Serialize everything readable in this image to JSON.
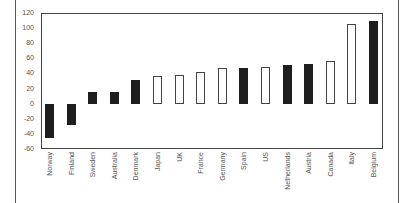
{
  "chart_data": {
    "type": "bar",
    "title": "",
    "xlabel": "",
    "ylabel": "",
    "ylim": [
      -60,
      120
    ],
    "yticks": [
      120,
      100,
      80,
      60,
      40,
      20,
      0,
      -20,
      -40,
      -60
    ],
    "grid": false,
    "legend": null,
    "categories": [
      "Norway",
      "Finland",
      "Sweden",
      "Australia",
      "Denmark",
      "Japan",
      "UK",
      "France",
      "Germany",
      "Spain",
      "US",
      "Netherlands",
      "Austria",
      "Canada",
      "Italy",
      "Belgium"
    ],
    "values": [
      -46,
      -28,
      15,
      16,
      31,
      36,
      38,
      42,
      47,
      47,
      49,
      51,
      52,
      57,
      105,
      109
    ],
    "bar_styles": [
      "filled",
      "filled",
      "filled",
      "filled",
      "filled",
      "hollow",
      "hollow",
      "hollow",
      "hollow",
      "filled",
      "hollow",
      "filled",
      "filled",
      "hollow",
      "hollow",
      "filled"
    ],
    "colors": {
      "filled": "#1e1e1e",
      "hollow_fill": "#ffffff",
      "outline": "#444444",
      "text": "#555555"
    }
  }
}
